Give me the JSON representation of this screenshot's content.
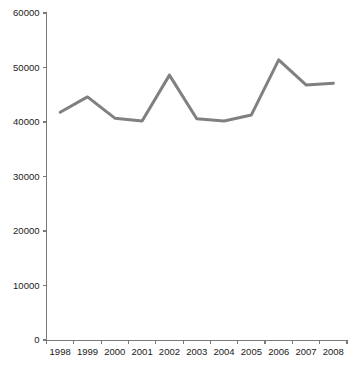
{
  "chart_data": {
    "type": "line",
    "title": "",
    "subtitle": "",
    "xlabel": "",
    "ylabel": "",
    "categories": [
      "1998",
      "1999",
      "2000",
      "2001",
      "2002",
      "2003",
      "2004",
      "2005",
      "2006",
      "2007",
      "2008"
    ],
    "values": [
      41800,
      44600,
      40700,
      40200,
      48600,
      40600,
      40200,
      41300,
      51400,
      46800,
      47100
    ],
    "series": [
      {
        "name": "",
        "values": [
          41800,
          44600,
          40700,
          40200,
          48600,
          40600,
          40200,
          41300,
          51400,
          46800,
          47100
        ]
      }
    ],
    "ylim": [
      0,
      60000
    ],
    "yticks": [
      0,
      10000,
      20000,
      30000,
      40000,
      50000,
      60000
    ],
    "ytick_labels": [
      "0",
      "10000",
      "20000",
      "30000",
      "40000",
      "50000",
      "60000"
    ],
    "xtick_labels": [
      "1998",
      "1999",
      "2000",
      "2001",
      "2002",
      "2003",
      "2004",
      "2005",
      "2006",
      "2007",
      "2008"
    ],
    "grid": false,
    "legend": false,
    "legend_position": "none",
    "annotations": [],
    "colors": {
      "line": "#808080",
      "axis": "#7a7a7a",
      "text": "#1a1a1a",
      "background": "#ffffff"
    }
  }
}
